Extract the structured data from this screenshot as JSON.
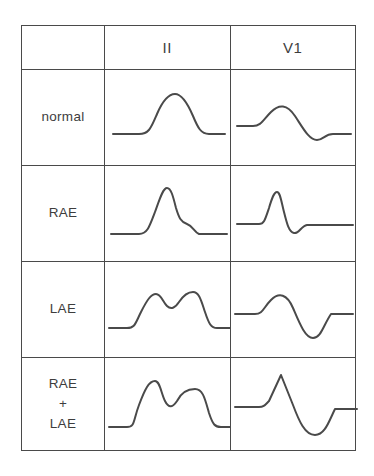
{
  "figure": {
    "line_color": "#4a4a4a",
    "background_color": "#ffffff",
    "text_color": "#3d3d3d"
  },
  "table": {
    "corner_label": "",
    "columns": [
      {
        "key": "label",
        "header": ""
      },
      {
        "key": "lead_ii",
        "header": "II"
      },
      {
        "key": "lead_v1",
        "header": "V1"
      }
    ],
    "rows": [
      {
        "id": "normal",
        "label_lines": [
          "normal"
        ],
        "lead_ii": {
          "name": "normal-lead-ii-waveform",
          "description": "single smooth rounded upright P wave",
          "path": "M 8 56 L 34 56 C 44 56 46 50 52 36 C 58 22 64 16 70 16 C 76 16 82 24 88 38 C 93 50 96 56 104 56 L 120 56"
        },
        "lead_v1": {
          "name": "normal-lead-v1-waveform",
          "description": "biphasic P wave: small positive deflection followed by shallow negative deflection",
          "path": "M 6 48 L 22 48 C 30 48 32 42 40 34 C 48 26 56 26 64 38 C 72 50 78 62 86 62 C 92 62 94 56 102 56 L 120 56"
        }
      },
      {
        "id": "rae",
        "label_lines": [
          "RAE"
        ],
        "lead_ii": {
          "name": "rae-lead-ii-waveform",
          "description": "tall peaked pulmonale P wave with shoulder on descending limb",
          "path": "M 6 60 L 34 60 C 42 60 44 54 50 38 C 55 24 58 14 62 14 C 66 14 68 22 71 34 C 74 44 76 48 82 50 C 88 52 89 58 94 60 L 122 60"
        },
        "lead_v1": {
          "name": "rae-lead-v1-waveform",
          "description": "sharp narrow tall positive spike with small terminal negative dip",
          "path": "M 6 50 L 28 50 C 33 50 34 46 38 34 C 41 24 43 18 46 18 C 49 18 50 26 53 38 C 56 50 58 58 63 59 C 68 60 70 52 76 51 L 122 51"
        }
      },
      {
        "id": "lae",
        "label_lines": [
          "LAE"
        ],
        "lead_ii": {
          "name": "lae-lead-ii-waveform",
          "description": "broad bifid notched P mitrale with two humps, second slightly taller",
          "path": "M 4 58 L 22 58 C 30 58 30 54 36 42 C 42 30 46 24 51 24 C 56 24 58 32 62 36 C 66 40 70 38 74 32 C 78 26 82 22 88 22 C 94 22 96 30 100 42 C 104 54 106 58 112 58 L 126 58"
        },
        "lead_v1": {
          "name": "lae-lead-v1-waveform",
          "description": "biphasic P wave with small positive hump and deep broad negative terminal component",
          "path": "M 4 44 L 24 44 C 32 44 32 38 40 30 C 48 22 56 24 62 38 C 68 52 74 68 82 68 C 90 68 92 56 100 44 L 122 44"
        }
      },
      {
        "id": "rae-lae",
        "label_lines": [
          "RAE",
          "+",
          "LAE"
        ],
        "lead_ii": {
          "name": "rae-lae-lead-ii-waveform",
          "description": "tall and broad bifid P wave: sharp first peak, notch, then wide second hump",
          "path": "M 4 62 L 22 62 C 30 62 28 56 34 40 C 40 24 44 16 50 16 C 55 16 56 28 60 36 C 64 44 68 42 72 36 C 76 28 82 24 90 24 C 98 24 100 34 104 48 C 108 60 110 62 116 62 L 130 62"
        },
        "lead_v1": {
          "name": "rae-lae-lead-v1-waveform",
          "description": "large biphasic P wave: tall sharp positive spike followed by deep wide negative trough",
          "path": "M 4 42 L 28 42 C 33 42 34 40 38 36 L 50 10 L 62 40 C 68 56 74 70 84 70 C 94 70 98 56 104 44 L 126 44"
        }
      }
    ]
  }
}
